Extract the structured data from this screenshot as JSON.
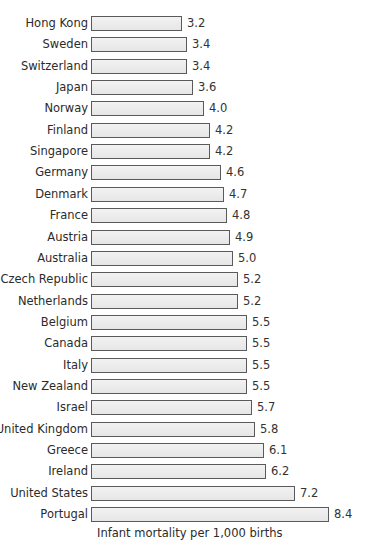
{
  "chart_data": {
    "type": "bar",
    "orientation": "horizontal",
    "title": "",
    "xlabel": "Infant mortality per 1,000 births",
    "ylabel": "",
    "categories": [
      "Hong Kong",
      "Sweden",
      "Switzerland",
      "Japan",
      "Norway",
      "Finland",
      "Singapore",
      "Germany",
      "Denmark",
      "France",
      "Austria",
      "Australia",
      "Czech Republic",
      "Netherlands",
      "Belgium",
      "Canada",
      "Italy",
      "New Zealand",
      "Israel",
      "United Kingdom",
      "Greece",
      "Ireland",
      "United States",
      "Portugal"
    ],
    "values": [
      3.2,
      3.4,
      3.4,
      3.6,
      4.0,
      4.2,
      4.2,
      4.6,
      4.7,
      4.8,
      4.9,
      5.0,
      5.2,
      5.2,
      5.5,
      5.5,
      5.5,
      5.5,
      5.7,
      5.8,
      6.1,
      6.2,
      7.2,
      8.4
    ],
    "value_labels": [
      "3.2",
      "3.4",
      "3.4",
      "3.6",
      "4.0",
      "4.2",
      "4.2",
      "4.6",
      "4.7",
      "4.8",
      "4.9",
      "5.0",
      "5.2",
      "5.2",
      "5.5",
      "5.5",
      "5.5",
      "5.5",
      "5.7",
      "5.8",
      "6.1",
      "6.2",
      "7.2",
      "8.4"
    ],
    "xlim": [
      0,
      9
    ],
    "grid": false,
    "legend": null,
    "colors": {
      "bar_fill": "#ececec",
      "bar_border": "#5a5a5a",
      "text": "#2b2b2b"
    }
  }
}
